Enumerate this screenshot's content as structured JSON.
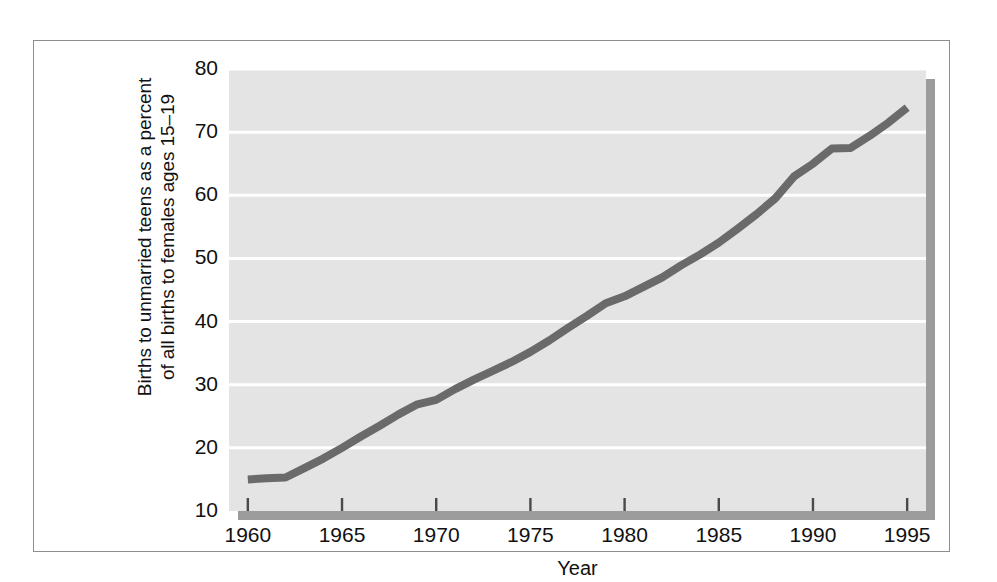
{
  "figure": {
    "y_axis_title_line1": "Births to unmarried teens as a percent",
    "y_axis_title_line2": "of all births to females ages 15–19",
    "x_axis_title": "Year",
    "colors": {
      "frame_border": "#8e8e8e",
      "plot_background": "#e4e4e4",
      "gridline": "#ffffff",
      "line_series": "#6a6a6a",
      "shadow": "#9c9c9c",
      "text": "#111111"
    }
  },
  "chart_data": {
    "type": "line",
    "title": "",
    "subtitle": "",
    "xlabel": "Year",
    "ylabel": "Births to unmarried teens as a percent of all births to females ages 15–19",
    "xlim": [
      1959,
      1996
    ],
    "ylim": [
      10,
      80
    ],
    "y_ticks": [
      10,
      20,
      30,
      40,
      50,
      60,
      70,
      80
    ],
    "y_tick_labels": [
      "10",
      "20",
      "30",
      "40",
      "50",
      "60",
      "70",
      "80"
    ],
    "x_ticks": [
      1960,
      1965,
      1970,
      1975,
      1980,
      1985,
      1990,
      1995
    ],
    "x_tick_labels": [
      "1960",
      "1965",
      "1970",
      "1975",
      "1980",
      "1985",
      "1990",
      "1995"
    ],
    "grid": "horizontal",
    "legend": "none",
    "annotations": [],
    "series": [
      {
        "name": "Births to unmarried teens as a percent of all births to females ages 15–19",
        "color": "#6a6a6a",
        "x": [
          1960,
          1961,
          1962,
          1963,
          1964,
          1965,
          1966,
          1967,
          1968,
          1969,
          1970,
          1971,
          1972,
          1973,
          1974,
          1975,
          1976,
          1977,
          1978,
          1979,
          1980,
          1981,
          1982,
          1983,
          1984,
          1985,
          1986,
          1987,
          1988,
          1989,
          1990,
          1991,
          1992,
          1993,
          1994,
          1995
        ],
        "values": [
          15.0,
          15.2,
          15.3,
          16.8,
          18.3,
          20.0,
          21.8,
          23.5,
          25.3,
          26.9,
          27.6,
          29.3,
          30.8,
          32.2,
          33.6,
          35.2,
          37.0,
          39.0,
          40.9,
          42.9,
          44.0,
          45.5,
          47.0,
          48.9,
          50.6,
          52.5,
          54.7,
          57.0,
          59.5,
          63.0,
          65.0,
          67.4,
          67.5,
          69.4,
          71.5,
          73.9
        ]
      }
    ]
  }
}
